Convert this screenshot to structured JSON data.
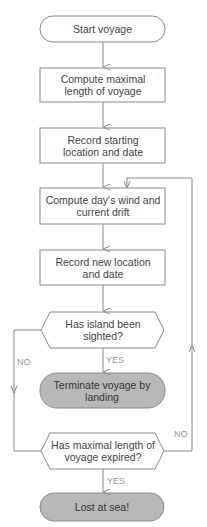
{
  "colors": {
    "line": "#8a8a8a",
    "text": "#444444",
    "label": "#999999",
    "terminal_fill": "#ffffff",
    "end_fill": "#b8b8b8"
  },
  "nodes": {
    "start": "Start voyage",
    "compute_max": "Compute maximal length of voyage",
    "record_start": "Record starting location and date",
    "compute_wind": "Compute day's wind and current drift",
    "record_new": "Record new location and date",
    "decision_island": "Has island been sighted?",
    "terminate": "Terminate voyage by landing",
    "decision_expired": "Has maximal length of voyage expired?",
    "lost": "Lost at sea!"
  },
  "labels": {
    "island_no": "NO",
    "island_yes": "YES",
    "expired_no": "NO",
    "expired_yes": "YES"
  }
}
